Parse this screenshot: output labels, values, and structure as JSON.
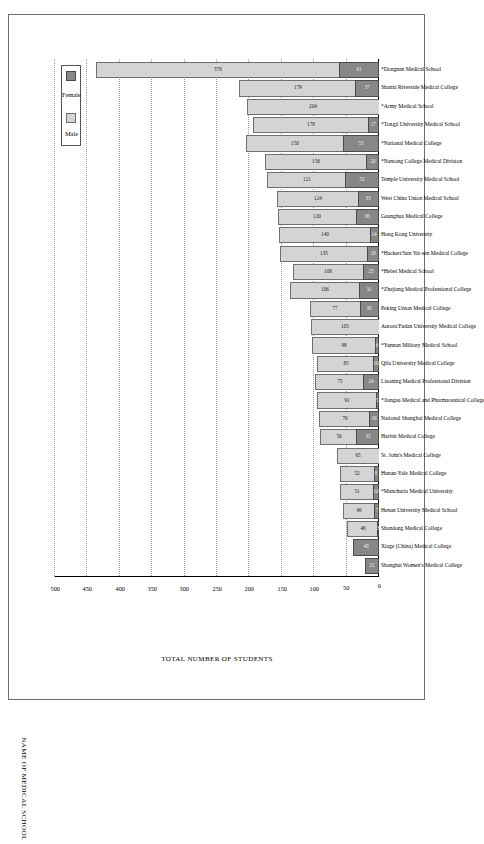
{
  "figure": {
    "border_color": "#6d6d6d",
    "orientation": "rotated-90"
  },
  "legend": {
    "position": "top-right-of-plot",
    "items": [
      {
        "label": "Female",
        "color": "#878787"
      },
      {
        "label": "Male",
        "color": "#d4d4d4"
      }
    ]
  },
  "axes": {
    "value_axis_title": "TOTAL NUMBER OF STUDENTS",
    "category_axis_title": "NAME OF MEDICAL SCHOOL",
    "value_ticks": [
      "0",
      "50",
      "100",
      "150",
      "200",
      "250",
      "300",
      "350",
      "400",
      "450",
      "500"
    ]
  },
  "chart_data": {
    "type": "bar",
    "title": "",
    "subtitle": "",
    "xlabel": "NAME OF MEDICAL SCHOOL",
    "ylabel": "TOTAL NUMBER OF STUDENTS",
    "ylim": [
      0,
      500
    ],
    "grid": true,
    "stacked": true,
    "orientation": "vertical-rotated",
    "legend_position": "top-right",
    "categories": [
      "Shanghai Women's Medical College",
      "Xiage (China) Medical College",
      "Shandong Medical College",
      "Henan University Medical School",
      "*Manchuria Medical University",
      "Hunan-Yale Medical College",
      "St. John's Medical College",
      "Harbin Medical College",
      "National Shanghai Medical College",
      "*Jiangsu Medical and Pharmaceutical College",
      "Liaoning Medical Professional Division",
      "Qilu University Medical College",
      "*Yunnan Military Medical School",
      "Aurora/Fudan University Medical College",
      "Peking Union Medical College",
      "*Zhejiang Medical Professional College",
      "*Hebei Medical School",
      "*Hackett/Sun Yat-sen Medical College",
      "Hong Kong University",
      "Guanghua Medical College",
      "West China Union Medical School",
      "Temple University Medical School",
      "*Nantong College Medical Division",
      "*National Medical College",
      "*Tongji University Medical School",
      "*Army Medical School",
      "Shanxi Riverside Medical College",
      "*Dongnan Medical School"
    ],
    "series": [
      {
        "name": "Female",
        "color": "#878787",
        "values": [
          21,
          40,
          3,
          7,
          10,
          8,
          0,
          35,
          16,
          5,
          24,
          10,
          6,
          0,
          30,
          31,
          25,
          18,
          14,
          36,
          33,
          52,
          20,
          55,
          17,
          0,
          37,
          61
        ]
      },
      {
        "name": "Male",
        "color": "#d4d4d4",
        "values": [
          0,
          0,
          46,
          49,
          51,
          52,
          65,
          56,
          76,
          91,
          75,
          85,
          98,
          105,
          77,
          106,
          108,
          135,
          140,
          120,
          124,
          121,
          156,
          150,
          178,
          204,
          179,
          376
        ]
      }
    ],
    "female_labels": [
      "21",
      "40",
      "3",
      "7",
      "10",
      "8",
      "",
      "35",
      "16",
      "5",
      "24",
      "10",
      "6",
      "",
      "30",
      "31",
      "25",
      "18",
      "14",
      "36",
      "33",
      "52",
      "20",
      "55",
      "17",
      "",
      "37",
      "61"
    ],
    "male_labels": [
      "",
      "",
      "46",
      "49",
      "51",
      "52",
      "65",
      "56",
      "76",
      "91",
      "75",
      "85",
      "98",
      "105",
      "77",
      "106",
      "108",
      "135",
      "140",
      "120",
      "124",
      "121",
      "156",
      "150",
      "178",
      "204",
      "179",
      "376"
    ]
  }
}
